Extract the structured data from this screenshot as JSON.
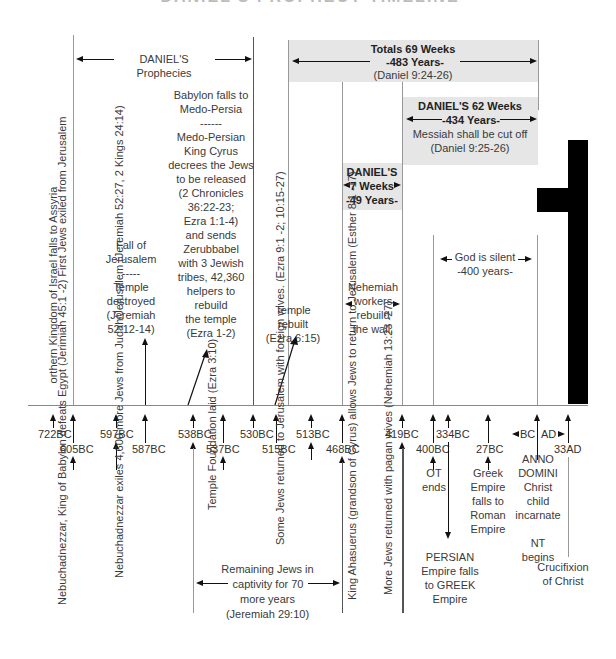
{
  "title": "DANIEL'S PROPHECY TIMELINE",
  "spans": {
    "daniels_prophecies": "DANIEL'S  Prophecies",
    "totals": {
      "line1": "Totals 69 Weeks",
      "line2": "-483 Years-",
      "line3": "(Daniel 9:24-26)"
    },
    "weeks62": {
      "line1": "DANIEL'S 62 Weeks",
      "line2": "-434 Years-",
      "line3": "Messiah shall be cut off",
      "line4": "(Daniel 9:25-26)"
    },
    "weeks7": {
      "line1": "DANIEL'S",
      "line2": "7 Weeks",
      "line3": "-49 Years-"
    },
    "silent": {
      "line1": "God is silent",
      "line2": "-400 years-"
    },
    "remaining": {
      "line1": "Remaining Jews in",
      "line2": "captivity for 70",
      "line3": "more years",
      "line4": "(Jeremiah 29:10)"
    }
  },
  "upper_notes": {
    "assyria": "orthern Kingdom of Israel falls to Assyria",
    "babylon": "Babylon falls to\nMedo-Persia\n------\nMedo-Persian\nKing Cyrus\ndecrees the Jews\nto be released\n(2 Chronicles\n36:22-23;\nEzra 1:1-4)\nand sends\nZerubbabel\nwith 3 Jewish\ntribes, 42,360\nhelpers to\nrebuild\nthe temple\n(Ezra 1-2)",
    "fall_jerusalem": "Fall of\nJerusalem\n-----\nTemple\ndestroyed\n(Jeremiah\n52:12-14)",
    "temple_rebuilt": "Temple\nrebuilt\n(Ezra 6:15)",
    "nehemiah": "Nehemiah\nworkers\nrebuild\nthe wall."
  },
  "ticks": [
    {
      "label": "722BC"
    },
    {
      "label": "605BC"
    },
    {
      "label": "597BC"
    },
    {
      "label": "587BC"
    },
    {
      "label": "538BC"
    },
    {
      "label": "537BC"
    },
    {
      "label": "530BC"
    },
    {
      "label": "515BC"
    },
    {
      "label": "513BC"
    },
    {
      "label": "468BC"
    },
    {
      "label": "419BC"
    },
    {
      "label": "400BC"
    },
    {
      "label": "334BC"
    },
    {
      "label": "27BC"
    },
    {
      "label": "BC"
    },
    {
      "label": "AD"
    },
    {
      "label": "33AD"
    }
  ],
  "lower_notes": {
    "nebuchadnezzar_605": "Nebuchadnezzar, King of Babylon\ndefeats Egypt (Jerimiah 45:1  -2)\nFirst Jews exiled from Jerusalem",
    "nebuchadnezzar_597": "Nebuchadnezzar exiles 4,600\nmore Jews from Judah/Jerusalem\n(Jeremiah 52:27,  2 Kings 24:14)",
    "temple_foundation": "Temple\nFoundation laid\n(Ezra 3:10)",
    "foreign_wives": "Some Jews returned\nto Jerusalem with\nforeign wives.\n(Ezra 9:1 -2; 10:15-27)",
    "ahasuerus": "King Ahasuerus (grandson of Cyrus)\nallows Jews to return to Jerusalem\n(Esther 8:1 -17)",
    "pagan_wives": "More Jews returned with pagan\nwives  (Nehemiah 13:23  -27)",
    "ot_ends": "OT\nends",
    "persian": "PERSIAN\nEmpire falls\nto GREEK\nEmpire",
    "greek": "Greek\nEmpire\nfalls to\nRoman\nEmpire",
    "anno_domini": "ANNO\nDOMINI\nChrist\nchild\nincarnate\n\nNT\nbegins",
    "crucifixion": "Crucifixion\nof Christ"
  },
  "colors": {
    "span_fill": "#e6e6e6",
    "cross": "#000000",
    "axis": "#888888"
  }
}
